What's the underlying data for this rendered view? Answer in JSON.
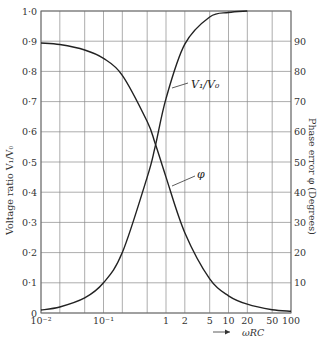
{
  "chart_data": {
    "type": "line",
    "title": "",
    "xlabel": "ωRC",
    "xlabel_arrow": "→",
    "xscale": "log",
    "xlim": [
      0.01,
      100
    ],
    "x_ticks": [
      {
        "value": 0.01,
        "label": "10⁻²"
      },
      {
        "value": 0.1,
        "label": "10⁻¹"
      },
      {
        "value": 1,
        "label": "1"
      },
      {
        "value": 2,
        "label": "2"
      },
      {
        "value": 5,
        "label": "5"
      },
      {
        "value": 10,
        "label": "10"
      },
      {
        "value": 20,
        "label": "20"
      },
      {
        "value": 50,
        "label": "50"
      },
      {
        "value": 100,
        "label": "100"
      }
    ],
    "x_gridlines": [
      0.01,
      0.02,
      0.05,
      0.1,
      0.2,
      0.5,
      1,
      2,
      5,
      10,
      20,
      50,
      100
    ],
    "left_axis": {
      "label": "Voltage ratio V₁/V₀",
      "ylim": [
        0,
        1.0
      ],
      "ticks": [
        "0",
        "0·1",
        "0·2",
        "0·3",
        "0·4",
        "0·5",
        "0·6",
        "0·7",
        "0·8",
        "0·9",
        "1·0"
      ]
    },
    "right_axis": {
      "label": "Phase error φ (Degrees)",
      "ylim": [
        0,
        100
      ],
      "ticks": [
        "10",
        "20",
        "30",
        "40",
        "50",
        "60",
        "70",
        "80",
        "90"
      ]
    },
    "grid": true,
    "series": [
      {
        "name": "V₁/V₀",
        "axis": "left",
        "x": [
          0.01,
          0.02,
          0.05,
          0.1,
          0.2,
          0.5,
          0.67,
          1,
          2,
          5,
          10,
          20
        ],
        "y": [
          0.01,
          0.02,
          0.05,
          0.1,
          0.2,
          0.45,
          0.55,
          0.71,
          0.89,
          0.98,
          0.995,
          1.0
        ]
      },
      {
        "name": "φ",
        "axis": "right",
        "x": [
          0.01,
          0.02,
          0.05,
          0.1,
          0.2,
          0.5,
          0.67,
          1,
          2,
          5,
          10,
          20,
          50,
          100
        ],
        "y": [
          89.4,
          88.9,
          87.1,
          84.3,
          78.7,
          63.4,
          56.2,
          45.0,
          26.6,
          11.3,
          5.7,
          2.9,
          1.1,
          0.6
        ]
      }
    ],
    "annotations": [
      {
        "text": "V₁/V₀",
        "points_to": "V₁/V₀ curve near ωRC≈1.2"
      },
      {
        "text": "φ",
        "points_to": "φ curve near ωRC≈1.1"
      }
    ]
  }
}
